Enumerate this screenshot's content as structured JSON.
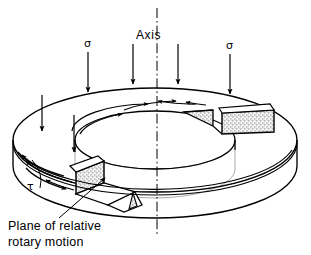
{
  "figure": {
    "kind": "engineering-isometric-diagram",
    "background_color": "#ffffff",
    "line_color": "#000000",
    "hidden_line_color": "#8a8a8a",
    "stipple_color": "#6b6b6b"
  },
  "labels": {
    "axis": "Axis",
    "sigma_left": "σ",
    "sigma_right": "σ",
    "tau": "τ",
    "caption_line1": "Plane of relative",
    "caption_line2": "rotary motion"
  },
  "annotations": {
    "centerline_style": "dash-dot",
    "sigma_arrow_count": 6,
    "sigma_direction": "downward",
    "tau_arrow_count": 7,
    "tau_direction": "circumferential",
    "cut_faces_shading": "stipple",
    "leader_target": "cut-plane-face"
  },
  "geometry": {
    "outer_cx": 155,
    "outer_cy": 140,
    "outer_rx": 142,
    "outer_ry": 52,
    "inner_rx": 80,
    "inner_ry": 29,
    "ring_thickness": 34
  }
}
